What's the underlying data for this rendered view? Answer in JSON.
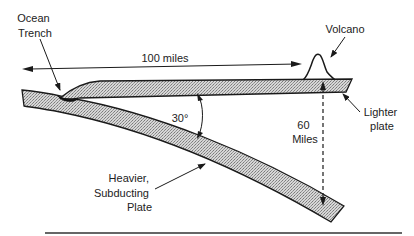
{
  "diagram": {
    "labels": {
      "ocean_trench": [
        "Ocean",
        "Trench"
      ],
      "distance": "100 miles",
      "volcano": "Volcano",
      "angle": "30°",
      "depth": [
        "60",
        "Miles"
      ],
      "lighter_plate": [
        "Lighter",
        "plate"
      ],
      "heavier_plate": [
        "Heavier,",
        "Subducting",
        "Plate"
      ]
    },
    "colors": {
      "plate_fill": "#bdbdbd",
      "stroke": "#1a1a1a",
      "text": "#222222"
    }
  }
}
